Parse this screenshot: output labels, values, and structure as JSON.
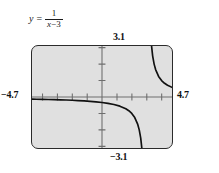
{
  "figure": {
    "equation": {
      "lhs": "y",
      "equals": "=",
      "numerator": "1",
      "denominator_variable": "x",
      "denominator_operator": "−",
      "denominator_constant": "3",
      "plain": "y = 1/(x - 3)"
    },
    "window_labels": {
      "ymax": "3.1",
      "ymin": "−3.1",
      "xmin": "−4.7",
      "xmax": "4.7"
    },
    "colors": {
      "plot_background": "#e0e0e0",
      "frame_border": "#2b2b2b",
      "axis": "#6e6e6e",
      "curve": "#111111",
      "text": "#111111",
      "page_background": "#ffffff"
    }
  },
  "chart_data": {
    "type": "line",
    "xlabel": "x",
    "ylabel": "y",
    "xlim": [
      -4.7,
      4.7
    ],
    "ylim": [
      -3.1,
      3.1
    ],
    "grid": false,
    "legend": null,
    "axis_ticks": {
      "x": [
        -4,
        -3,
        -2,
        -1,
        1,
        2,
        3,
        4
      ],
      "y": [
        -3,
        -2,
        -1,
        1,
        2,
        3
      ],
      "tick_spacing": 1
    },
    "annotations": [
      {
        "text": "3.1",
        "role": "y-axis-maximum",
        "position": "above-plot-top-at-y-axis"
      },
      {
        "text": "-3.1",
        "role": "y-axis-minimum",
        "position": "below-plot-bottom-at-y-axis"
      },
      {
        "text": "-4.7",
        "role": "x-axis-minimum",
        "position": "left-of-plot-at-x-axis"
      },
      {
        "text": "4.7",
        "role": "x-axis-maximum",
        "position": "right-of-plot-at-x-axis"
      }
    ],
    "vertical_asymptote": 3,
    "horizontal_asymptote": 0,
    "series": [
      {
        "name": "left branch (x < 3)",
        "x": [
          -4.7,
          -4.4,
          -4.0,
          -3.6,
          -3.2,
          -2.8,
          -2.4,
          -2.0,
          -1.6,
          -1.2,
          -0.8,
          -0.4,
          0.0,
          0.4,
          0.8,
          1.2,
          1.6,
          1.8,
          2.0,
          2.2,
          2.4,
          2.5,
          2.6,
          2.7,
          2.75,
          2.8,
          2.85,
          2.9,
          2.93,
          2.95,
          2.97
        ],
        "y": [
          -0.13,
          -0.135,
          -0.143,
          -0.152,
          -0.161,
          -0.172,
          -0.185,
          -0.2,
          -0.217,
          -0.238,
          -0.263,
          -0.294,
          -0.333,
          -0.385,
          -0.455,
          -0.556,
          -0.714,
          -0.833,
          -1.0,
          -1.25,
          -1.667,
          -2.0,
          -2.5,
          -3.333,
          -4.0,
          -5.0,
          -6.667,
          -10.0,
          -14.286,
          -20.0,
          -33.333
        ]
      },
      {
        "name": "right branch (x > 3)",
        "x": [
          3.03,
          3.05,
          3.07,
          3.1,
          3.15,
          3.2,
          3.25,
          3.3,
          3.4,
          3.5,
          3.6,
          3.8,
          4.0,
          4.2,
          4.4,
          4.7
        ],
        "y": [
          33.333,
          20.0,
          14.286,
          10.0,
          6.667,
          5.0,
          4.0,
          3.333,
          2.5,
          2.0,
          1.667,
          1.25,
          1.0,
          0.833,
          0.714,
          0.588
        ]
      }
    ]
  }
}
